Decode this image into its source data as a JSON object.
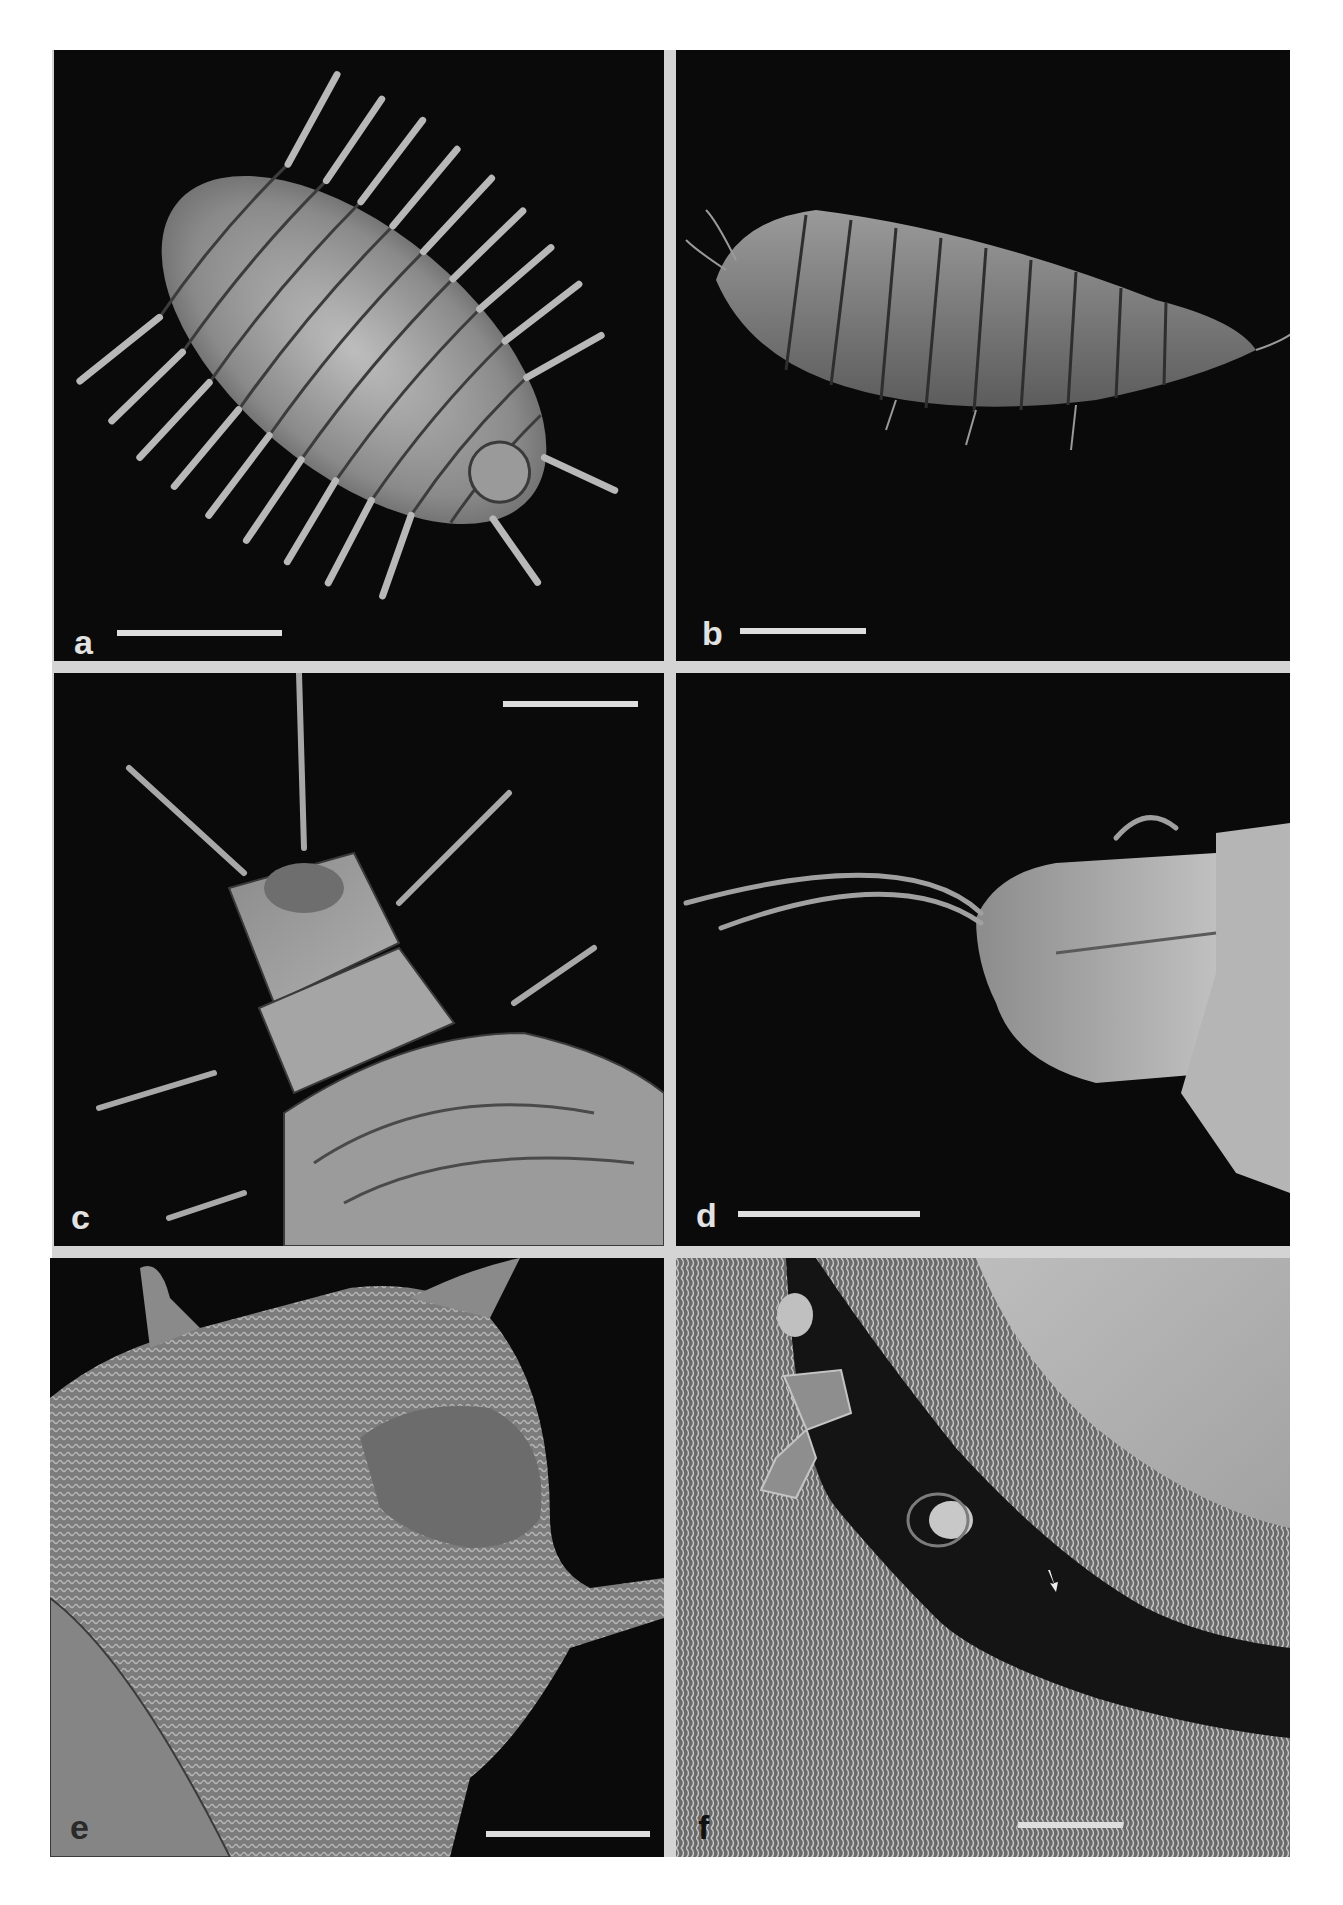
{
  "figure": {
    "type": "SEM micrograph plate",
    "background_color": "#ffffff",
    "divider_color": "#d4d4d4",
    "panel_background": "#0a0a0a",
    "panels": [
      {
        "id": "a",
        "label": "a",
        "content": "larva, dorsal view, whole body with lateral spinose processes",
        "scale_bar": {
          "x1": 117,
          "x2": 282,
          "y": 630
        }
      },
      {
        "id": "b",
        "label": "b",
        "content": "larva, lateral view, whole body",
        "scale_bar": {
          "x1": 740,
          "x2": 866,
          "y": 628
        }
      },
      {
        "id": "c",
        "label": "c",
        "content": "head and thoracic segments with long setae and branched processes",
        "scale_bar": {
          "x1": 503,
          "x2": 638,
          "y": 704
        }
      },
      {
        "id": "d",
        "label": "d",
        "content": "terminal abdominal segment with long curved processes",
        "scale_bar": {
          "x1": 738,
          "x2": 920,
          "y": 1211
        }
      },
      {
        "id": "e",
        "label": "e",
        "content": "close-up of segment surface with fine microtrichia",
        "scale_bar": {
          "x1": 486,
          "x2": 650,
          "y": 1831
        }
      },
      {
        "id": "f",
        "label": "f",
        "content": "detail of cuticle with sensilla and arrow marker",
        "scale_bar": {
          "x1": 1018,
          "x2": 1123,
          "y": 1822
        },
        "arrow": "white-arrow"
      }
    ]
  }
}
